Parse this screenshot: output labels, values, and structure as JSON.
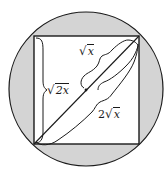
{
  "diagram": {
    "colors": {
      "circle_fill": "#d4d4d4",
      "square_fill": "#ffffff",
      "stroke": "#1a1a1a"
    },
    "circle": {
      "cx": 86,
      "cy": 89,
      "r": 77
    },
    "square": {
      "x1": 34,
      "y1": 36,
      "x2": 139,
      "y2": 144
    },
    "labels": {
      "side": {
        "coef": "",
        "radicand": "2x",
        "text": "√2x"
      },
      "half_diagonal": {
        "coef": "",
        "radicand": "x",
        "text": "√x"
      },
      "diagonal": {
        "coef": "2",
        "radicand": "x",
        "text": "2√x"
      }
    },
    "midpoint": {
      "x": 86,
      "y": 90
    }
  }
}
